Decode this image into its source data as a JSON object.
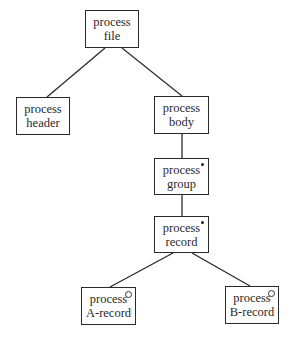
{
  "diagram": {
    "type": "Jackson structure diagram",
    "nodes": [
      {
        "id": "file",
        "line1": "process",
        "line2": "file",
        "marker": "none",
        "box": [
          85,
          10,
          54,
          38
        ]
      },
      {
        "id": "header",
        "line1": "process",
        "line2": "header",
        "marker": "none",
        "box": [
          16,
          97,
          54,
          38
        ]
      },
      {
        "id": "body",
        "line1": "process",
        "line2": "body",
        "marker": "none",
        "box": [
          154,
          96,
          55,
          38
        ]
      },
      {
        "id": "group",
        "line1": "process",
        "line2": "group",
        "marker": "iteration",
        "marker_symbol": "*",
        "box": [
          154,
          158,
          55,
          37
        ]
      },
      {
        "id": "record",
        "line1": "process",
        "line2": "record",
        "marker": "iteration",
        "marker_symbol": "*",
        "box": [
          154,
          216,
          55,
          37
        ]
      },
      {
        "id": "a_record",
        "line1": "process",
        "line2": "A-record",
        "marker": "selection",
        "marker_symbol": "o",
        "box": [
          81,
          287,
          55,
          38
        ]
      },
      {
        "id": "b_record",
        "line1": "process",
        "line2": "B-record",
        "marker": "selection",
        "marker_symbol": "o",
        "box": [
          225,
          286,
          54,
          38
        ]
      }
    ],
    "edges": [
      {
        "from": "file",
        "to": "header"
      },
      {
        "from": "file",
        "to": "body"
      },
      {
        "from": "body",
        "to": "group"
      },
      {
        "from": "group",
        "to": "record"
      },
      {
        "from": "record",
        "to": "a_record"
      },
      {
        "from": "record",
        "to": "b_record"
      }
    ]
  }
}
